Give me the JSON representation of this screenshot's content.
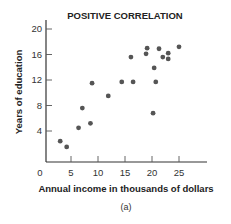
{
  "chart_data": {
    "type": "scatter",
    "title": "POSITIVE CORRELATION",
    "xlabel": "Annual income in thousands of dollars",
    "ylabel": "Years of education",
    "caption": "(a)",
    "xlim": [
      0,
      30
    ],
    "ylim": [
      0,
      21
    ],
    "xticks": [
      0,
      5,
      10,
      15,
      20,
      25
    ],
    "yticks": [
      4,
      8,
      12,
      16,
      20
    ],
    "grid": false,
    "legend": null,
    "marker_color": "#555555",
    "series": [
      {
        "name": "observations",
        "points": [
          {
            "x": 3.0,
            "y": 2.4
          },
          {
            "x": 4.2,
            "y": 1.5
          },
          {
            "x": 6.4,
            "y": 4.5
          },
          {
            "x": 7.1,
            "y": 7.6
          },
          {
            "x": 8.6,
            "y": 5.2
          },
          {
            "x": 8.9,
            "y": 11.5
          },
          {
            "x": 11.9,
            "y": 9.5
          },
          {
            "x": 14.4,
            "y": 11.7
          },
          {
            "x": 16.1,
            "y": 15.6
          },
          {
            "x": 16.5,
            "y": 11.7
          },
          {
            "x": 18.9,
            "y": 16.1
          },
          {
            "x": 19.1,
            "y": 17.0
          },
          {
            "x": 20.2,
            "y": 6.8
          },
          {
            "x": 20.4,
            "y": 13.9
          },
          {
            "x": 20.7,
            "y": 11.7
          },
          {
            "x": 21.3,
            "y": 16.9
          },
          {
            "x": 22.0,
            "y": 15.6
          },
          {
            "x": 23.0,
            "y": 16.2
          },
          {
            "x": 23.0,
            "y": 15.3
          },
          {
            "x": 25.0,
            "y": 17.2
          }
        ]
      }
    ]
  }
}
